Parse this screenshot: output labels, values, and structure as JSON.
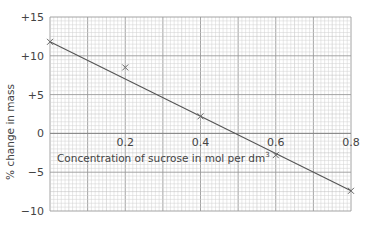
{
  "chart_data": {
    "type": "line",
    "title": "",
    "xlabel": "Concentration of sucrose in mol per dm",
    "xlabel_superscript": "3",
    "ylabel": "% change in mass",
    "xlim": [
      0,
      0.8
    ],
    "ylim": [
      -10,
      15
    ],
    "x_ticks": [
      {
        "value": 0.2,
        "label": "0.2"
      },
      {
        "value": 0.4,
        "label": "0.4"
      },
      {
        "value": 0.6,
        "label": "0.6"
      },
      {
        "value": 0.8,
        "label": "0.8"
      }
    ],
    "y_ticks": [
      {
        "value": 15,
        "label": "+15"
      },
      {
        "value": 10,
        "label": "+10"
      },
      {
        "value": 5,
        "label": "+5"
      },
      {
        "value": 0,
        "label": "0"
      },
      {
        "value": -5,
        "label": "−5"
      },
      {
        "value": -10,
        "label": "−10"
      }
    ],
    "grid": true,
    "series": [
      {
        "name": "measured points",
        "marker": "x",
        "x": [
          0.0,
          0.2,
          0.4,
          0.6,
          0.8
        ],
        "y": [
          11.8,
          8.5,
          2.2,
          -2.8,
          -7.4
        ]
      },
      {
        "name": "line of best fit",
        "marker": "none",
        "x": [
          0.0,
          0.8
        ],
        "y": [
          11.8,
          -7.4
        ]
      }
    ],
    "colors": {
      "line": "#555555",
      "marker": "#666666",
      "grid_minor": "#d0d0d0",
      "grid_major": "#9a9a9a",
      "text": "#444444"
    }
  }
}
